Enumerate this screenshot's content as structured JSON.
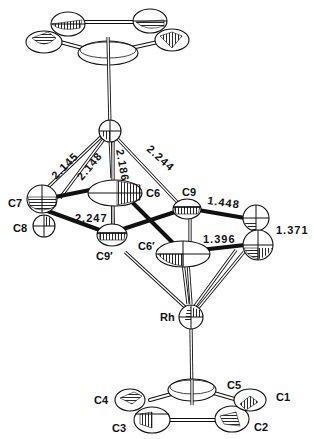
{
  "figure": {
    "type": "ORTEP molecular structure diagram",
    "atom_labels": {
      "C1": "C1",
      "C2": "C2",
      "C3": "C3",
      "C4": "C4",
      "C5": "C5",
      "C6": "C6",
      "C7": "C7",
      "C8": "C8",
      "C9": "C9",
      "C6p": "C6′",
      "C9p": "C9′",
      "Rh": "Rh"
    },
    "bond_distances": {
      "d1": "2.145",
      "d2": "2.148",
      "d3": "2.186",
      "d4": "2.244",
      "d5": "2.247",
      "d6": "1.448",
      "d7": "1.371",
      "d8": "1.396"
    }
  }
}
